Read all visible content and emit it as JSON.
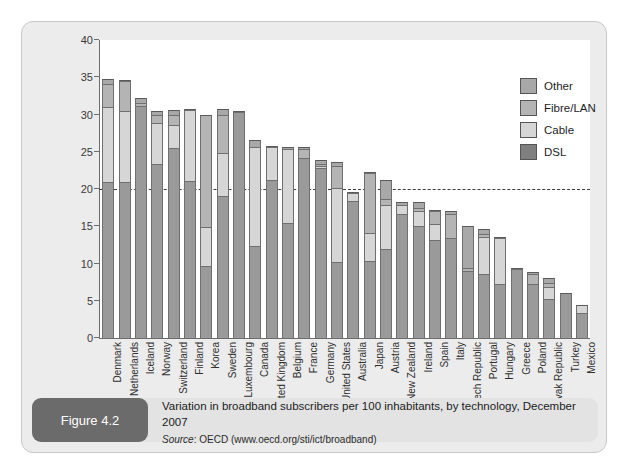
{
  "figure": {
    "tag": "Figure 4.2",
    "title": "Variation in broadband subscribers per 100 inhabitants, by technology, December 2007",
    "source_word": "Source",
    "source_text": ": OECD (www.oecd.org/sti/ict/broadband)"
  },
  "chart_data": {
    "type": "bar",
    "stacked": true,
    "title": "Variation in broadband subscribers per 100 inhabitants, by technology, December 2007",
    "xlabel": "",
    "ylabel": "",
    "ylim": [
      0,
      40
    ],
    "yticks": [
      0,
      5,
      10,
      15,
      20,
      25,
      30,
      35,
      40
    ],
    "grid": false,
    "legend_position": "top-right",
    "reference_line": {
      "value": 20,
      "style": "dashed"
    },
    "categories": [
      "Denmark",
      "Netherlands",
      "Iceland",
      "Norway",
      "Switzerland",
      "Finland",
      "Korea",
      "Sweden",
      "Luxembourg",
      "Canada",
      "United Kingdom",
      "Belgium",
      "France",
      "Germany",
      "United States",
      "Australia",
      "Japan",
      "Austria",
      "New Zealand",
      "Ireland",
      "Spain",
      "Italy",
      "Czech Republic",
      "Portugal",
      "Hungary",
      "Greece",
      "Poland",
      "Slovak Republic",
      "Turkey",
      "Mexico"
    ],
    "series": [
      {
        "name": "DSL",
        "color": "#9a9a9a",
        "values": [
          21.0,
          20.9,
          31.2,
          23.4,
          25.5,
          21.1,
          9.7,
          19.0,
          30.4,
          12.4,
          21.2,
          15.5,
          24.2,
          22.8,
          10.2,
          18.4,
          10.4,
          11.9,
          16.6,
          15.0,
          13.1,
          13.4,
          9.0,
          8.6,
          7.2,
          9.3,
          7.2,
          5.2,
          6.0,
          3.4
        ]
      },
      {
        "name": "Cable",
        "color": "#d6d6d6",
        "values": [
          10.0,
          9.6,
          0.0,
          5.4,
          3.1,
          9.5,
          5.2,
          5.9,
          0.0,
          13.3,
          4.4,
          9.9,
          0.0,
          0.3,
          9.9,
          1.1,
          3.7,
          5.9,
          1.2,
          2.0,
          2.2,
          0.0,
          0.0,
          5.0,
          6.2,
          0.0,
          0.0,
          1.7,
          0.0,
          1.0
        ]
      },
      {
        "name": "Fibre/LAN",
        "color": "#b4b4b4",
        "values": [
          3.1,
          4.0,
          0.4,
          1.2,
          1.4,
          0.0,
          15.1,
          5.1,
          0.0,
          0.0,
          0.0,
          0.0,
          1.2,
          0.3,
          3.0,
          0.0,
          8.0,
          0.9,
          0.0,
          0.5,
          1.8,
          3.3,
          0.4,
          0.4,
          0.2,
          0.0,
          1.4,
          0.5,
          0.0,
          0.0
        ]
      },
      {
        "name": "Other",
        "color": "#a8a8a8",
        "values": [
          0.7,
          0.2,
          0.6,
          0.5,
          0.6,
          0.1,
          0.0,
          0.7,
          0.1,
          0.9,
          0.2,
          0.2,
          0.3,
          0.5,
          0.5,
          0.1,
          0.2,
          2.5,
          0.5,
          0.8,
          0.1,
          0.3,
          5.6,
          0.6,
          0.0,
          0.1,
          0.3,
          0.7,
          0.0,
          0.0
        ]
      }
    ],
    "totals": [
      34.8,
      34.7,
      32.2,
      30.5,
      30.6,
      30.7,
      30.0,
      30.7,
      30.5,
      26.6,
      25.8,
      25.6,
      25.7,
      23.9,
      23.6,
      19.6,
      22.3,
      21.2,
      18.3,
      18.3,
      17.2,
      17.0,
      15.0,
      14.6,
      13.6,
      9.4,
      8.9,
      8.1,
      6.0,
      4.4
    ]
  },
  "legend": {
    "items": [
      {
        "label": "Other",
        "color": "#a8a8a8"
      },
      {
        "label": "Fibre/LAN",
        "color": "#b4b4b4"
      },
      {
        "label": "Cable",
        "color": "#d6d6d6"
      },
      {
        "label": "DSL",
        "color": "#7f7f7f"
      }
    ]
  }
}
